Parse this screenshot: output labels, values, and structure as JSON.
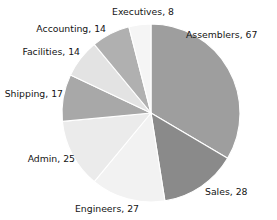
{
  "chart_data": {
    "type": "pie",
    "title": "",
    "subtitle": "",
    "xlabel": "",
    "ylabel": "",
    "total": 200,
    "legend": "none",
    "grid": false,
    "label_format": "category, value",
    "start_angle_deg": 0,
    "direction": "clockwise",
    "categories": [
      "Assemblers",
      "Sales",
      "Engineers",
      "Admin",
      "Shipping",
      "Facilities",
      "Accounting",
      "Executives"
    ],
    "values": [
      67,
      28,
      27,
      25,
      17,
      14,
      14,
      8
    ],
    "colors": [
      "#9e9e9e",
      "#8a8a8a",
      "#f2f2f2",
      "#ebebeb",
      "#a8a8a8",
      "#e3e3e3",
      "#b0b0b0",
      "#f5f5f5"
    ],
    "slice_separator_color": "#ffffff",
    "background_color": "#ffffff",
    "label_color": "#141414",
    "slices": [
      {
        "label": "Assemblers, 67",
        "category": "Assemblers",
        "value": 67,
        "color": "#9e9e9e"
      },
      {
        "label": "Sales, 28",
        "category": "Sales",
        "value": 28,
        "color": "#8a8a8a"
      },
      {
        "label": "Engineers, 27",
        "category": "Engineers",
        "value": 27,
        "color": "#f2f2f2"
      },
      {
        "label": "Admin, 25",
        "category": "Admin",
        "value": 25,
        "color": "#ebebeb"
      },
      {
        "label": "Shipping, 17",
        "category": "Shipping",
        "value": 17,
        "color": "#a8a8a8"
      },
      {
        "label": "Facilities, 14",
        "category": "Facilities",
        "value": 14,
        "color": "#e3e3e3"
      },
      {
        "label": "Accounting, 14",
        "category": "Accounting",
        "value": 14,
        "color": "#b0b0b0"
      },
      {
        "label": "Executives, 8",
        "category": "Executives",
        "value": 8,
        "color": "#f5f5f5"
      }
    ]
  },
  "geometry": {
    "center_x": 151,
    "center_y": 113,
    "radius": 89
  },
  "labels": {
    "assemblers": "Assemblers, 67",
    "sales": "Sales, 28",
    "engineers": "Engineers, 27",
    "admin": "Admin, 25",
    "shipping": "Shipping, 17",
    "facilities": "Facilities, 14",
    "accounting": "Accounting, 14",
    "executives": "Executives, 8"
  }
}
